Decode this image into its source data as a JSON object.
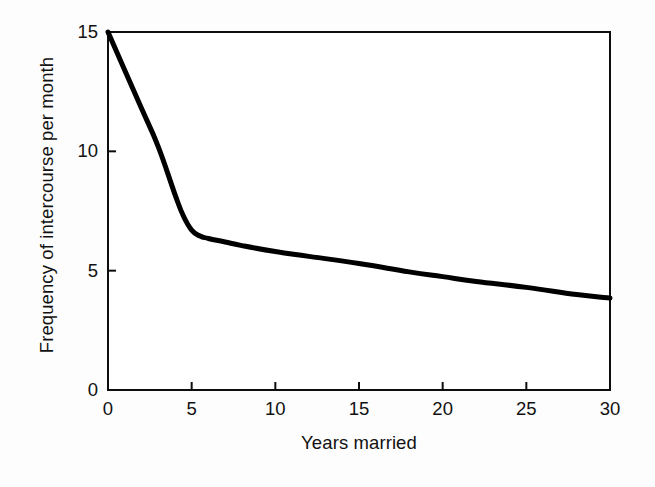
{
  "chart_data": {
    "type": "line",
    "title": "",
    "subtitle": "",
    "xlabel": "Years married",
    "ylabel": "Frequency of intercourse per month",
    "xlim": [
      0,
      30
    ],
    "ylim": [
      0,
      15
    ],
    "xticks": [
      0,
      5,
      10,
      15,
      20,
      25,
      30
    ],
    "yticks": [
      0,
      5,
      10,
      15
    ],
    "xtick_labels": [
      "0",
      "5",
      "10",
      "15",
      "20",
      "25",
      "30"
    ],
    "ytick_labels": [
      "0",
      "5",
      "10",
      "15"
    ],
    "grid": false,
    "legend": false,
    "legend_position": "none",
    "series": [
      {
        "name": "Frequency of intercourse per month",
        "color": "#000000",
        "line_width": 5,
        "x": [
          0,
          1,
          2,
          3,
          4,
          4.5,
          5,
          5.5,
          6,
          7,
          8,
          10,
          12,
          15,
          18,
          20,
          22,
          25,
          28,
          30
        ],
        "values": [
          15.0,
          13.4,
          11.8,
          10.2,
          8.2,
          7.3,
          6.7,
          6.45,
          6.35,
          6.2,
          6.05,
          5.8,
          5.6,
          5.3,
          4.95,
          4.75,
          4.55,
          4.3,
          4.0,
          3.85
        ]
      }
    ],
    "annotations": []
  },
  "axes": {
    "frame": {
      "border_color": "#0d0d0d",
      "border_width": 2
    },
    "tick_direction": "in",
    "tick_length": 8
  },
  "figure": {
    "background_color": "#fdfdfd",
    "plot_background_color": "#ffffff",
    "width": 655,
    "height": 487
  }
}
